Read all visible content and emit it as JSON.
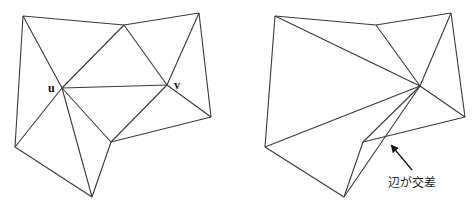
{
  "left_diagram": {
    "description": "Valid triangulation with edge u-v",
    "vertices": {
      "A": [
        23,
        16
      ],
      "B": [
        124,
        25
      ],
      "C": [
        199,
        13
      ],
      "u": [
        62,
        88
      ],
      "v": [
        167,
        85
      ],
      "D": [
        15,
        147
      ],
      "E": [
        111,
        142
      ],
      "F": [
        211,
        117
      ],
      "G": [
        92,
        197
      ]
    },
    "edges": [
      [
        "A",
        "B"
      ],
      [
        "B",
        "C"
      ],
      [
        "C",
        "F"
      ],
      [
        "F",
        "E"
      ],
      [
        "E",
        "G"
      ],
      [
        "G",
        "D"
      ],
      [
        "D",
        "A"
      ],
      [
        "A",
        "u"
      ],
      [
        "u",
        "B"
      ],
      [
        "B",
        "v"
      ],
      [
        "v",
        "C"
      ],
      [
        "u",
        "v"
      ],
      [
        "v",
        "F"
      ],
      [
        "v",
        "E"
      ],
      [
        "u",
        "E"
      ],
      [
        "u",
        "G"
      ],
      [
        "u",
        "D"
      ]
    ],
    "labels": {
      "u": "u",
      "v": "v"
    }
  },
  "right_diagram": {
    "description": "Triangulation after edge flip causing crossing edges",
    "vertices": {
      "A": [
        275,
        16
      ],
      "B": [
        376,
        25
      ],
      "C": [
        451,
        13
      ],
      "V": [
        420,
        86
      ],
      "D": [
        265,
        147
      ],
      "E": [
        363,
        142
      ],
      "F": [
        465,
        117
      ],
      "G": [
        344,
        197
      ]
    },
    "edges": [
      [
        "A",
        "B"
      ],
      [
        "B",
        "C"
      ],
      [
        "C",
        "F"
      ],
      [
        "F",
        "E"
      ],
      [
        "E",
        "G"
      ],
      [
        "G",
        "D"
      ],
      [
        "D",
        "A"
      ],
      [
        "A",
        "V"
      ],
      [
        "B",
        "V"
      ],
      [
        "C",
        "V"
      ],
      [
        "V",
        "F"
      ],
      [
        "V",
        "D"
      ],
      [
        "V",
        "E"
      ],
      [
        "V",
        "G"
      ]
    ],
    "annotation": {
      "text": "辺が交差",
      "arrow_from": [
        412,
        170
      ],
      "arrow_to": [
        392,
        146
      ]
    }
  }
}
